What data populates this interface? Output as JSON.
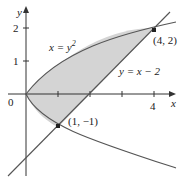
{
  "diagram": {
    "axes": {
      "x_label": "x",
      "y_label": "y",
      "origin_label": "0",
      "x_ticks": [
        {
          "value": 4,
          "label": "4"
        }
      ],
      "y_ticks": [
        {
          "value": 1,
          "label": "1"
        },
        {
          "value": 2,
          "label": "2"
        }
      ]
    },
    "curves": [
      {
        "name": "parabola",
        "equation": "x = y²",
        "label_main": "x = y",
        "label_sup": "2"
      },
      {
        "name": "line",
        "equation": "y = x − 2",
        "label": "y = x − 2"
      }
    ],
    "points": [
      {
        "label": "(4, 2)",
        "x": 4,
        "y": 2
      },
      {
        "label": "(1, −1)",
        "x": 1,
        "y": -1
      }
    ],
    "shaded_region": "region bounded by x = y² and y = x − 2",
    "colors": {
      "shade": "#d4d4d4",
      "curve": "#555555",
      "axis": "#333333"
    }
  }
}
